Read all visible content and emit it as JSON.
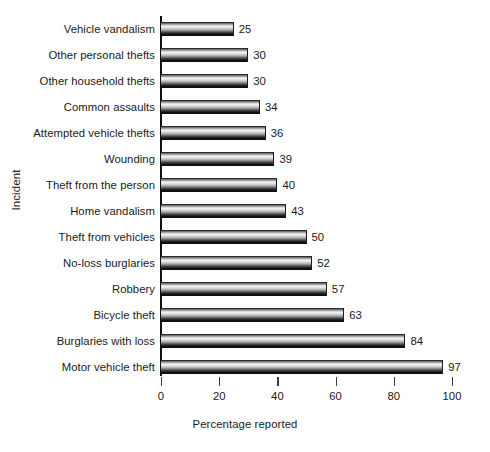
{
  "chart_data": {
    "type": "bar",
    "orientation": "horizontal",
    "title": "",
    "xlabel": "Percentage reported",
    "ylabel": "Incident",
    "xlim": [
      0,
      100
    ],
    "xticks": [
      0,
      20,
      40,
      60,
      80,
      100
    ],
    "grid": false,
    "legend": false,
    "data_labels": true,
    "categories": [
      "Vehicle vandalism",
      "Other personal thefts",
      "Other household thefts",
      "Common assaults",
      "Attempted vehicle thefts",
      "Wounding",
      "Theft from the person",
      "Home vandalism",
      "Theft from vehicles",
      "No-loss burglaries",
      "Robbery",
      "Bicycle theft",
      "Burglaries with loss",
      "Motor vehicle theft"
    ],
    "values": [
      25,
      30,
      30,
      34,
      36,
      39,
      40,
      43,
      50,
      52,
      57,
      63,
      84,
      97
    ]
  },
  "axes": {
    "x_title": "Percentage reported",
    "y_title": "Incident",
    "x_tick_labels": [
      "0",
      "20",
      "40",
      "60",
      "80",
      "100"
    ]
  },
  "bars": [
    {
      "label": "Vehicle vandalism",
      "value": "25"
    },
    {
      "label": "Other personal thefts",
      "value": "30"
    },
    {
      "label": "Other household thefts",
      "value": "30"
    },
    {
      "label": "Common assaults",
      "value": "34"
    },
    {
      "label": "Attempted vehicle thefts",
      "value": "36"
    },
    {
      "label": "Wounding",
      "value": "39"
    },
    {
      "label": "Theft from the person",
      "value": "40"
    },
    {
      "label": "Home vandalism",
      "value": "43"
    },
    {
      "label": "Theft from vehicles",
      "value": "50"
    },
    {
      "label": "No-loss burglaries",
      "value": "52"
    },
    {
      "label": "Robbery",
      "value": "57"
    },
    {
      "label": "Bicycle theft",
      "value": "63"
    },
    {
      "label": "Burglaries with loss",
      "value": "84"
    },
    {
      "label": "Motor vehicle theft",
      "value": "97"
    }
  ],
  "style": {
    "bar_highlight": "#f2f2f2",
    "bar_shadow": "#0b0b0b",
    "axis_color": "#101010",
    "text_color": "#1a1a1a",
    "background": "#ffffff"
  }
}
